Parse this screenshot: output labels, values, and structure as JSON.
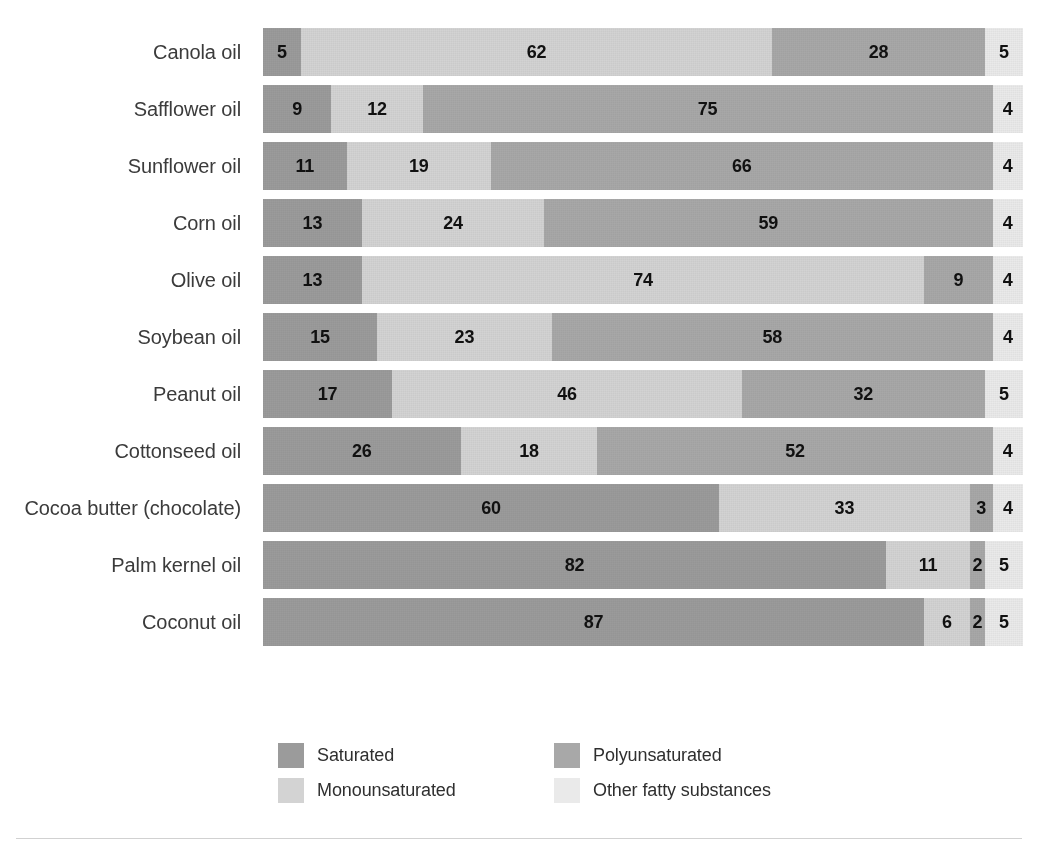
{
  "top_caption": "",
  "chart_data": {
    "type": "bar",
    "orientation": "horizontal",
    "stacked": true,
    "normalized_percent": true,
    "title": "",
    "xlabel": "",
    "ylabel": "",
    "xlim": [
      0,
      100
    ],
    "grid": false,
    "legend_position": "bottom",
    "categories": [
      "Canola oil",
      "Safflower oil",
      "Sunflower oil",
      "Corn oil",
      "Olive oil",
      "Soybean oil",
      "Peanut oil",
      "Cottonseed oil",
      "Cocoa butter (chocolate)",
      "Palm kernel oil",
      "Coconut oil"
    ],
    "series": [
      {
        "name": "Saturated",
        "color": "#9b9b9b",
        "values": [
          5,
          9,
          11,
          13,
          13,
          15,
          17,
          26,
          60,
          82,
          87
        ]
      },
      {
        "name": "Monounsaturated",
        "color": "#d3d3d3",
        "values": [
          62,
          12,
          19,
          24,
          74,
          23,
          46,
          18,
          33,
          11,
          6
        ]
      },
      {
        "name": "Polyunsaturated",
        "color": "#a8a8a8",
        "values": [
          28,
          75,
          66,
          59,
          9,
          58,
          32,
          52,
          3,
          2,
          2
        ]
      },
      {
        "name": "Other fatty substances",
        "color": "#eaeaea",
        "values": [
          5,
          4,
          4,
          4,
          4,
          4,
          5,
          4,
          4,
          5,
          5
        ]
      }
    ],
    "rows": [
      {
        "label": "Canola oil",
        "segments": [
          {
            "series": "Saturated",
            "value": 5
          },
          {
            "series": "Monounsaturated",
            "value": 62
          },
          {
            "series": "Polyunsaturated",
            "value": 28
          },
          {
            "series": "Other fatty substances",
            "value": 5
          }
        ]
      },
      {
        "label": "Safflower oil",
        "segments": [
          {
            "series": "Saturated",
            "value": 9
          },
          {
            "series": "Monounsaturated",
            "value": 12
          },
          {
            "series": "Polyunsaturated",
            "value": 75
          },
          {
            "series": "Other fatty substances",
            "value": 4
          }
        ]
      },
      {
        "label": "Sunflower oil",
        "segments": [
          {
            "series": "Saturated",
            "value": 11
          },
          {
            "series": "Monounsaturated",
            "value": 19
          },
          {
            "series": "Polyunsaturated",
            "value": 66
          },
          {
            "series": "Other fatty substances",
            "value": 4
          }
        ]
      },
      {
        "label": "Corn oil",
        "segments": [
          {
            "series": "Saturated",
            "value": 13
          },
          {
            "series": "Monounsaturated",
            "value": 24
          },
          {
            "series": "Polyunsaturated",
            "value": 59
          },
          {
            "series": "Other fatty substances",
            "value": 4
          }
        ]
      },
      {
        "label": "Olive oil",
        "segments": [
          {
            "series": "Saturated",
            "value": 13
          },
          {
            "series": "Monounsaturated",
            "value": 74
          },
          {
            "series": "Polyunsaturated",
            "value": 9
          },
          {
            "series": "Other fatty substances",
            "value": 4
          }
        ]
      },
      {
        "label": "Soybean oil",
        "segments": [
          {
            "series": "Saturated",
            "value": 15
          },
          {
            "series": "Monounsaturated",
            "value": 23
          },
          {
            "series": "Polyunsaturated",
            "value": 58
          },
          {
            "series": "Other fatty substances",
            "value": 4
          }
        ]
      },
      {
        "label": "Peanut oil",
        "segments": [
          {
            "series": "Saturated",
            "value": 17
          },
          {
            "series": "Monounsaturated",
            "value": 46
          },
          {
            "series": "Polyunsaturated",
            "value": 32
          },
          {
            "series": "Other fatty substances",
            "value": 5
          }
        ]
      },
      {
        "label": "Cottonseed oil",
        "segments": [
          {
            "series": "Saturated",
            "value": 26
          },
          {
            "series": "Monounsaturated",
            "value": 18
          },
          {
            "series": "Polyunsaturated",
            "value": 52
          },
          {
            "series": "Other fatty substances",
            "value": 4
          }
        ]
      },
      {
        "label": "Cocoa butter (chocolate)",
        "segments": [
          {
            "series": "Saturated",
            "value": 60
          },
          {
            "series": "Monounsaturated",
            "value": 33
          },
          {
            "series": "Polyunsaturated",
            "value": 3
          },
          {
            "series": "Other fatty substances",
            "value": 4
          }
        ]
      },
      {
        "label": "Palm kernel oil",
        "segments": [
          {
            "series": "Saturated",
            "value": 82
          },
          {
            "series": "Monounsaturated",
            "value": 11
          },
          {
            "series": "Polyunsaturated",
            "value": 2
          },
          {
            "series": "Other fatty substances",
            "value": 5
          }
        ]
      },
      {
        "label": "Coconut oil",
        "segments": [
          {
            "series": "Saturated",
            "value": 87
          },
          {
            "series": "Monounsaturated",
            "value": 6
          },
          {
            "series": "Polyunsaturated",
            "value": 2
          },
          {
            "series": "Other fatty substances",
            "value": 5
          }
        ]
      }
    ]
  },
  "legend": {
    "items": [
      {
        "label": "Saturated",
        "color": "#9b9b9b"
      },
      {
        "label": "Polyunsaturated",
        "color": "#a8a8a8"
      },
      {
        "label": "Monounsaturated",
        "color": "#d3d3d3"
      },
      {
        "label": "Other fatty substances",
        "color": "#eaeaea"
      }
    ]
  },
  "colors": {
    "saturated": "#9b9b9b",
    "monounsaturated": "#d3d3d3",
    "polyunsaturated": "#a8a8a8",
    "other": "#eaeaea",
    "label_text": "#3b3b3b",
    "value_text": "#111111",
    "rule": "#c9c9c9",
    "background": "#ffffff"
  }
}
